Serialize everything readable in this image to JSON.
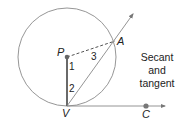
{
  "diagram": {
    "caption_lines": [
      "Secant",
      "and",
      "tangent"
    ],
    "points": {
      "P": {
        "label": "P",
        "x": 67,
        "y": 57
      },
      "A": {
        "label": "A",
        "x": 115,
        "y": 41
      },
      "V": {
        "label": "V",
        "x": 67,
        "y": 106
      },
      "C": {
        "label": "C",
        "x": 146,
        "y": 106
      }
    },
    "angles": [
      "1",
      "2",
      "3"
    ],
    "circle": {
      "center": "P",
      "radius": 49
    },
    "colors": {
      "stroke": "#888888",
      "radius": "#444444",
      "point": "#666666",
      "text": "#222222"
    }
  }
}
